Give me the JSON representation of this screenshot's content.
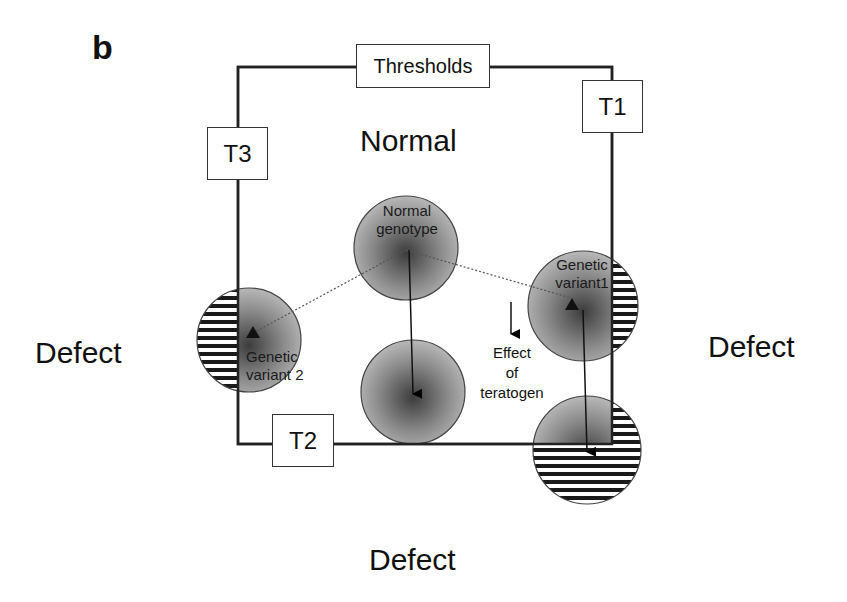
{
  "panel": {
    "letter": "b"
  },
  "regions": {
    "normal": "Normal",
    "defect_left": "Defect",
    "defect_right": "Defect",
    "defect_bottom": "Defect"
  },
  "thresholds": {
    "title": "Thresholds",
    "t1": "T1",
    "t2": "T2",
    "t3": "T3"
  },
  "genotypes": [
    {
      "id": "normal",
      "label_line1": "Normal",
      "label_line2": "genotype"
    },
    {
      "id": "variant1",
      "label_line1": "Genetic",
      "label_line2": "variant1"
    },
    {
      "id": "variant2",
      "label_line1": "Genetic",
      "label_line2": "variant 2"
    }
  ],
  "legend": {
    "effect_line1": "Effect",
    "effect_line2": "of",
    "effect_line3": "teratogen"
  },
  "colors": {
    "frame": "#222222",
    "circle_center": "#3a3a3a",
    "circle_edge": "#b5b5b5",
    "stripe": "#1a1a1a"
  }
}
